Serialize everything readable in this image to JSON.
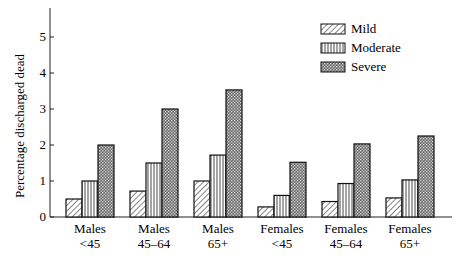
{
  "chart_data": {
    "type": "bar",
    "title": "",
    "xlabel": "",
    "ylabel": "Percentage discharged dead",
    "ylim": [
      0,
      5.5
    ],
    "yticks": [
      0,
      1,
      2,
      3,
      4,
      5
    ],
    "grid": false,
    "legend_position": "upper right",
    "categories": [
      {
        "line1": "Males",
        "line2": "<45"
      },
      {
        "line1": "Males",
        "line2": "45–64"
      },
      {
        "line1": "Males",
        "line2": "65+"
      },
      {
        "line1": "Females",
        "line2": "<45"
      },
      {
        "line1": "Females",
        "line2": "45–64"
      },
      {
        "line1": "Females",
        "line2": "65+"
      }
    ],
    "series": [
      {
        "name": "Mild",
        "pattern": "diagonal-hatch",
        "values": [
          0.5,
          0.72,
          1.0,
          0.28,
          0.43,
          0.53
        ]
      },
      {
        "name": "Moderate",
        "pattern": "vertical-lines",
        "values": [
          1.0,
          1.5,
          1.72,
          0.6,
          0.93,
          1.03
        ]
      },
      {
        "name": "Severe",
        "pattern": "crosshatch-dense",
        "values": [
          2.0,
          3.0,
          3.53,
          1.52,
          2.03,
          2.25
        ]
      }
    ]
  }
}
